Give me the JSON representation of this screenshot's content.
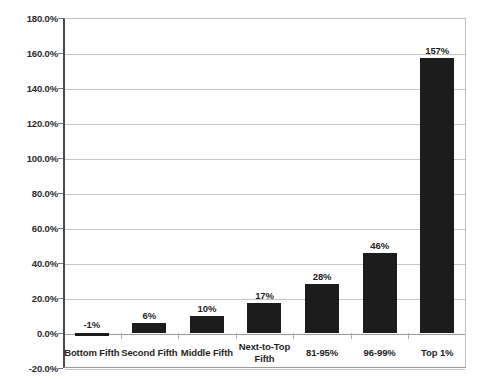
{
  "chart_data": {
    "type": "bar",
    "title": "",
    "subtitle": "",
    "xlabel": "",
    "ylabel": "",
    "categories": [
      "Bottom Fifth",
      "Second Fifth",
      "Middle Fifth",
      "Next-to-Top Fifth",
      "81-95%",
      "96-99%",
      "Top 1%"
    ],
    "values": [
      -1,
      6,
      10,
      17,
      28,
      46,
      157
    ],
    "data_labels": [
      "-1%",
      "6%",
      "10%",
      "17%",
      "28%",
      "46%",
      "157%"
    ],
    "ylim": [
      -20,
      180
    ],
    "ytick_values": [
      180,
      160,
      140,
      120,
      100,
      80,
      60,
      40,
      20,
      0,
      -20
    ],
    "ytick_labels": [
      "180.0%",
      "160.0%",
      "140.0%",
      "120.0%",
      "100.0%",
      "80.0%",
      "60.0%",
      "40.0%",
      "20.0%",
      "0.0%",
      "-20.0%"
    ],
    "grid": true,
    "legend": false,
    "bar_color": "#1c1c1c",
    "gridline_color": "#c4c4c4",
    "axis_color": "#4a4a4a",
    "background_color": "#ffffff"
  }
}
